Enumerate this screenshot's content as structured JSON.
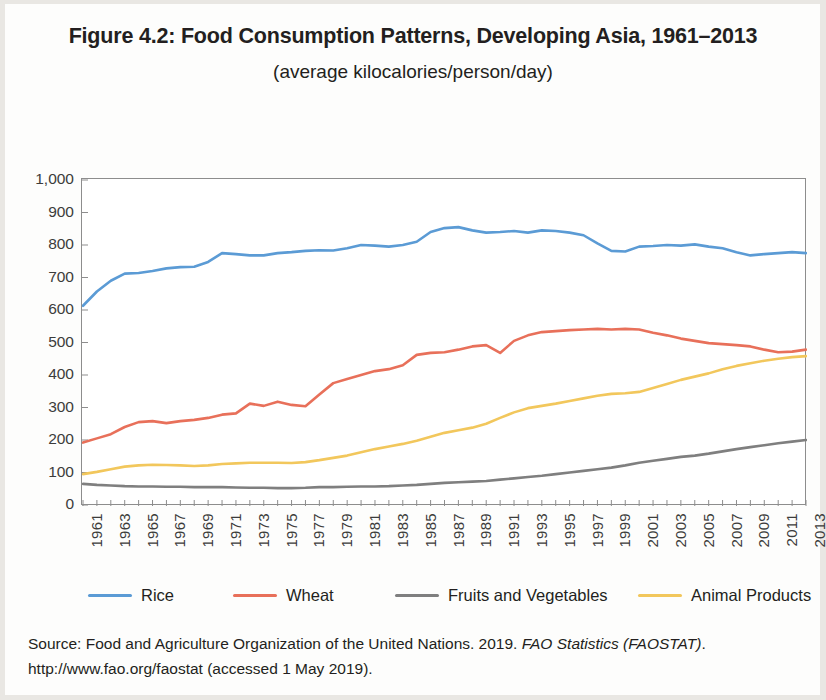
{
  "figure": {
    "title": "Figure 4.2: Food Consumption Patterns, Developing Asia, 1961–2013",
    "subtitle": "(average kilocalories/person/day)"
  },
  "source": {
    "line1_prefix": "Source: Food and Agriculture Organization of the United Nations. 2019. ",
    "line1_italic": "FAO Statistics (FAOSTAT)",
    "line1_suffix": ".",
    "line2": "http://www.fao.org/faostat (accessed 1 May 2019)."
  },
  "legend": {
    "items": [
      {
        "label": "Rice",
        "color": "#5B9BD5"
      },
      {
        "label": "Wheat",
        "color": "#E8705A"
      },
      {
        "label": "Fruits and Vegetables",
        "color": "#7F7F7F"
      },
      {
        "label": "Animal Products",
        "color": "#F2C75C"
      }
    ]
  },
  "chart_data": {
    "type": "line",
    "title": "Figure 4.2: Food Consumption Patterns, Developing Asia, 1961–2013",
    "subtitle": "(average kilocalories/person/day)",
    "xlabel": "",
    "ylabel": "",
    "ylim": [
      0,
      1000
    ],
    "ytick_step": 100,
    "ytick_labels": [
      "0",
      "100",
      "200",
      "300",
      "400",
      "500",
      "600",
      "700",
      "800",
      "900",
      "1,000"
    ],
    "grid": false,
    "legend_position": "bottom",
    "xlim": [
      1961,
      2013
    ],
    "xtick_labels": [
      "1961",
      "1963",
      "1965",
      "1967",
      "1969",
      "1971",
      "1973",
      "1975",
      "1977",
      "1979",
      "1981",
      "1983",
      "1985",
      "1987",
      "1989",
      "1991",
      "1993",
      "1995",
      "1997",
      "1999",
      "2001",
      "2003",
      "2005",
      "2007",
      "2009",
      "2011",
      "2013"
    ],
    "x": [
      1961,
      1962,
      1963,
      1964,
      1965,
      1966,
      1967,
      1968,
      1969,
      1970,
      1971,
      1972,
      1973,
      1974,
      1975,
      1976,
      1977,
      1978,
      1979,
      1980,
      1981,
      1982,
      1983,
      1984,
      1985,
      1986,
      1987,
      1988,
      1989,
      1990,
      1991,
      1992,
      1993,
      1994,
      1995,
      1996,
      1997,
      1998,
      1999,
      2000,
      2001,
      2002,
      2003,
      2004,
      2005,
      2006,
      2007,
      2008,
      2009,
      2010,
      2011,
      2012,
      2013
    ],
    "series": [
      {
        "name": "Rice",
        "color": "#5B9BD5",
        "values": [
          613,
          657,
          690,
          712,
          714,
          720,
          728,
          732,
          733,
          748,
          775,
          772,
          768,
          768,
          775,
          778,
          782,
          784,
          783,
          790,
          800,
          798,
          795,
          800,
          810,
          840,
          852,
          855,
          845,
          838,
          840,
          843,
          838,
          845,
          843,
          838,
          830,
          805,
          782,
          780,
          795,
          797,
          800,
          798,
          802,
          795,
          790,
          778,
          768,
          772,
          775,
          778,
          775
        ]
      },
      {
        "name": "Wheat",
        "color": "#E8705A",
        "values": [
          192,
          205,
          218,
          240,
          255,
          258,
          252,
          258,
          262,
          268,
          278,
          282,
          312,
          305,
          318,
          308,
          304,
          340,
          375,
          388,
          400,
          412,
          418,
          430,
          462,
          468,
          470,
          478,
          488,
          492,
          468,
          505,
          522,
          532,
          535,
          538,
          540,
          542,
          540,
          542,
          540,
          530,
          522,
          512,
          505,
          498,
          495,
          492,
          488,
          478,
          470,
          472,
          478
        ]
      },
      {
        "name": "Fruits and Vegetables",
        "color": "#7F7F7F",
        "values": [
          65,
          62,
          60,
          58,
          57,
          57,
          56,
          56,
          55,
          55,
          55,
          54,
          53,
          53,
          52,
          52,
          53,
          55,
          55,
          56,
          57,
          57,
          58,
          60,
          62,
          65,
          68,
          70,
          72,
          74,
          78,
          82,
          86,
          90,
          95,
          100,
          105,
          110,
          115,
          122,
          130,
          136,
          142,
          148,
          152,
          158,
          165,
          172,
          178,
          184,
          190,
          195,
          200
        ]
      },
      {
        "name": "Animal Products",
        "color": "#F2C75C",
        "values": [
          95,
          102,
          110,
          118,
          122,
          124,
          123,
          122,
          120,
          122,
          126,
          128,
          130,
          130,
          130,
          129,
          132,
          138,
          145,
          152,
          162,
          172,
          180,
          188,
          198,
          210,
          222,
          230,
          238,
          250,
          268,
          285,
          298,
          305,
          312,
          320,
          328,
          336,
          342,
          344,
          348,
          360,
          372,
          385,
          395,
          405,
          418,
          428,
          436,
          444,
          450,
          455,
          458
        ]
      }
    ]
  }
}
